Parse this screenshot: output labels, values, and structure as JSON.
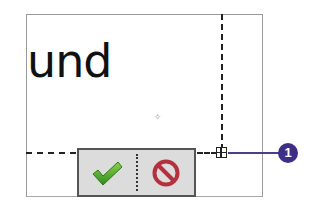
{
  "canvas": {
    "text": "und",
    "cursor_icon": "crosshair-cursor-icon"
  },
  "toolbar": {
    "accept_icon": "checkmark-icon",
    "cancel_icon": "cancel-prohibited-icon",
    "accept_color": "#4caf2a",
    "cancel_color": "#b5303d"
  },
  "callout": {
    "number": "1",
    "color": "#3e2f86"
  },
  "crosshair_glyph": "✧"
}
